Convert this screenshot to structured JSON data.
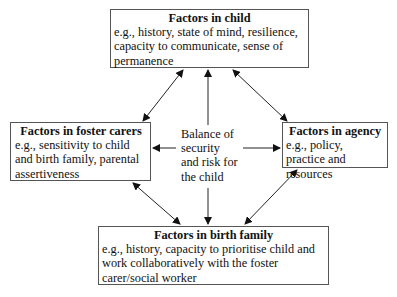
{
  "diagram": {
    "center": {
      "lines": [
        "Balance of",
        "security",
        "and risk for",
        "the child"
      ]
    },
    "nodes": {
      "child": {
        "title": "Factors in child",
        "body": "e.g., history, state of mind, resilience, capacity to communicate, sense of permanence"
      },
      "foster": {
        "title": "Factors in foster carers",
        "body": "e.g., sensitivity to child and birth family, parental assertiveness"
      },
      "agency": {
        "title": "Factors in agency",
        "body": "e.g., policy, practice and resources"
      },
      "birth": {
        "title": "Factors in birth family",
        "body": "e.g., history, capacity to prioritise child and work collaboratively with the foster carer/social worker"
      }
    },
    "edges": [
      {
        "from": "foster",
        "to": "child",
        "type": "bidirectional"
      },
      {
        "from": "agency",
        "to": "child",
        "type": "bidirectional"
      },
      {
        "from": "foster",
        "to": "birth",
        "type": "bidirectional"
      },
      {
        "from": "agency",
        "to": "birth",
        "type": "bidirectional"
      },
      {
        "from": "center",
        "to": "child",
        "type": "directed"
      },
      {
        "from": "center",
        "to": "birth",
        "type": "directed"
      },
      {
        "from": "center",
        "to": "foster",
        "type": "directed"
      },
      {
        "from": "center",
        "to": "agency",
        "type": "directed"
      }
    ]
  }
}
